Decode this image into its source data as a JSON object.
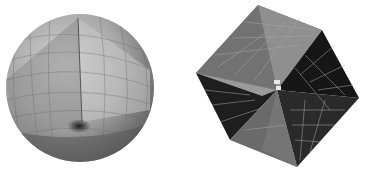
{
  "figure": {
    "panels": [
      {
        "id": "sphere",
        "subject": "shaded polygonal mesh sphere with cutaway wedge",
        "colors": {
          "light": "#cfcfcf",
          "mid": "#9a9a9a",
          "dark": "#5a5a5a",
          "grid": "#7d7d7d"
        }
      },
      {
        "id": "hollow-cube",
        "subject": "hollow cube mesh with inverted pyramidal faces",
        "colors": {
          "face_light": "#8c8c8c",
          "face_mid": "#6e6e6e",
          "face_dark": "#1c1c1c",
          "grid": "#b0b0b0"
        }
      }
    ]
  }
}
